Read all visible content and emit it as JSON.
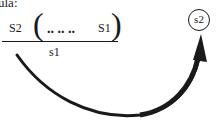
{
  "caption": "ula:",
  "fraction": {
    "numerator_left": "S2",
    "paren_open": "(",
    "dots": ".. .. ..",
    "numerator_right": "S1",
    "paren_close": ")",
    "denominator": "s1"
  },
  "target": {
    "label": "s2"
  },
  "colors": {
    "ink": "#1a1a1a",
    "background": "#ffffff"
  }
}
